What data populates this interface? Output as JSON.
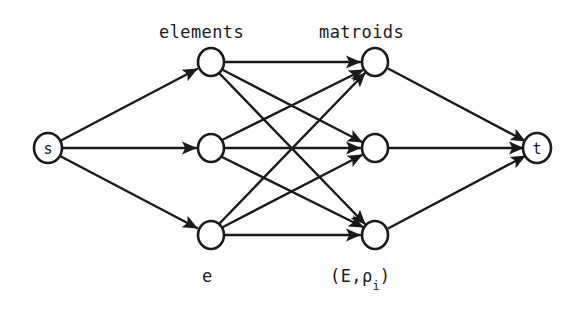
{
  "figure": {
    "type": "flow-network-diagram",
    "background_color": "#fefefe",
    "ink_color": "#1a1a1a",
    "width": 579,
    "height": 315
  },
  "labels": {
    "elements": "elements",
    "matroids": "matroids",
    "element_generic": "e",
    "matroid_generic_prefix": "(E,ρ",
    "matroid_generic_subscript": "i",
    "matroid_generic_suffix": ")"
  },
  "nodes": {
    "source": {
      "id": "s",
      "label": "s",
      "cx": 48,
      "cy": 148,
      "rx": 14,
      "ry": 15
    },
    "sink": {
      "id": "t",
      "label": "t",
      "cx": 537,
      "cy": 148,
      "rx": 14,
      "ry": 15
    },
    "left": [
      {
        "id": "e1",
        "label": "",
        "cx": 211,
        "cy": 62,
        "rx": 13,
        "ry": 14
      },
      {
        "id": "e2",
        "label": "",
        "cx": 211,
        "cy": 148,
        "rx": 13,
        "ry": 14
      },
      {
        "id": "e3",
        "label": "",
        "cx": 211,
        "cy": 235,
        "rx": 13,
        "ry": 14
      }
    ],
    "right": [
      {
        "id": "m1",
        "label": "",
        "cx": 375,
        "cy": 62,
        "rx": 13,
        "ry": 14
      },
      {
        "id": "m2",
        "label": "",
        "cx": 375,
        "cy": 148,
        "rx": 13,
        "ry": 14
      },
      {
        "id": "m3",
        "label": "",
        "cx": 375,
        "cy": 235,
        "rx": 13,
        "ry": 14
      }
    ]
  },
  "edges": {
    "source_to_left": [
      [
        "s",
        "e1"
      ],
      [
        "s",
        "e2"
      ],
      [
        "s",
        "e3"
      ]
    ],
    "bipartite": [
      [
        "e1",
        "m1"
      ],
      [
        "e1",
        "m2"
      ],
      [
        "e1",
        "m3"
      ],
      [
        "e2",
        "m1"
      ],
      [
        "e2",
        "m2"
      ],
      [
        "e2",
        "m3"
      ],
      [
        "e3",
        "m1"
      ],
      [
        "e3",
        "m2"
      ],
      [
        "e3",
        "m3"
      ]
    ],
    "right_to_sink": [
      [
        "m1",
        "t"
      ],
      [
        "m2",
        "t"
      ],
      [
        "m3",
        "t"
      ]
    ],
    "directed": true,
    "arrowhead": "solid-filled-triangle",
    "stroke_width": 2.4
  }
}
